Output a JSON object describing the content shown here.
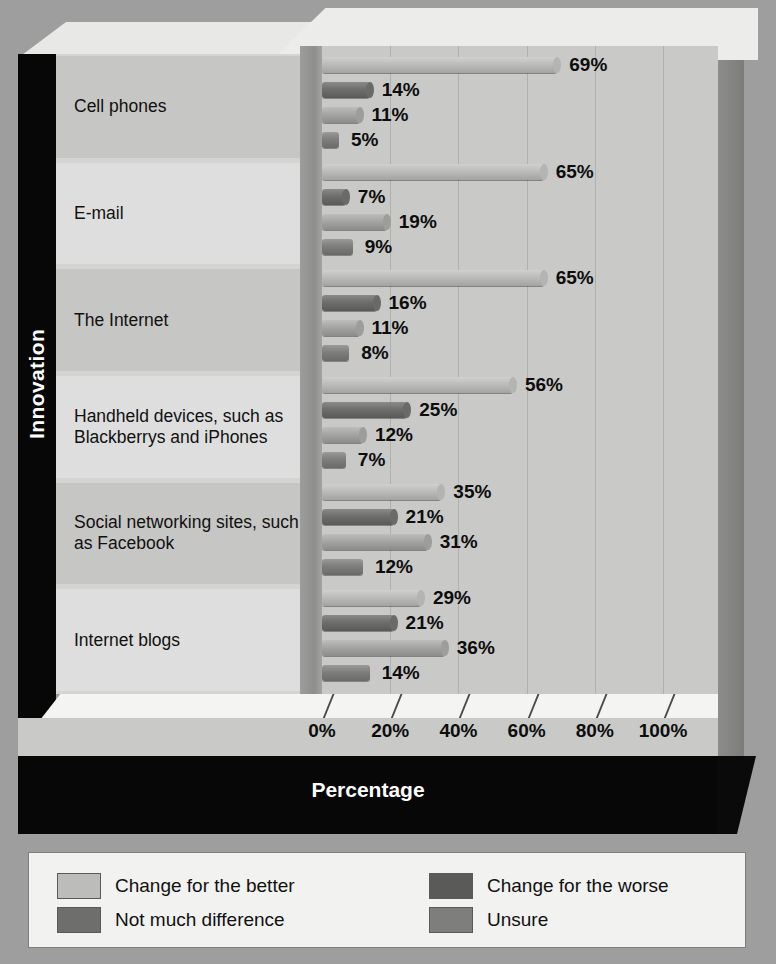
{
  "axis": {
    "y_title": "Innovation",
    "x_title": "Percentage",
    "x_ticks": [
      "0%",
      "20%",
      "40%",
      "60%",
      "80%",
      "100%"
    ]
  },
  "legend": {
    "items": [
      {
        "label": "Change for the better",
        "color": "#bcbcba"
      },
      {
        "label": "Change for the worse",
        "color": "#5a5a58"
      },
      {
        "label": "Not much difference",
        "color": "#6e6e6c"
      },
      {
        "label": "Unsure",
        "color": "#7e7e7c"
      }
    ]
  },
  "chart_data": {
    "type": "bar",
    "orientation": "horizontal",
    "title": "",
    "xlabel": "Percentage",
    "ylabel": "Innovation",
    "xlim": [
      0,
      100
    ],
    "xticks": [
      0,
      20,
      40,
      60,
      80,
      100
    ],
    "grid": true,
    "legend_position": "bottom",
    "categories": [
      "Cell phones",
      "E-mail",
      "The Internet",
      "Handheld devices, such as Blackberrys and iPhones",
      "Social networking sites, such as Facebook",
      "Internet blogs"
    ],
    "series": [
      {
        "name": "Change for the better",
        "values": [
          69,
          65,
          65,
          56,
          35,
          29
        ]
      },
      {
        "name": "Change for the worse",
        "values": [
          14,
          7,
          16,
          25,
          21,
          21
        ]
      },
      {
        "name": "Not much difference",
        "values": [
          11,
          19,
          11,
          12,
          31,
          36
        ]
      },
      {
        "name": "Unsure",
        "values": [
          5,
          9,
          8,
          7,
          12,
          14
        ]
      }
    ],
    "data_labels": [
      [
        "69%",
        "14%",
        "11%",
        "5%"
      ],
      [
        "65%",
        "7%",
        "19%",
        "9%"
      ],
      [
        "65%",
        "16%",
        "11%",
        "8%"
      ],
      [
        "56%",
        "25%",
        "12%",
        "7%"
      ],
      [
        "35%",
        "21%",
        "31%",
        "12%"
      ],
      [
        "29%",
        "21%",
        "36%",
        "14%"
      ]
    ]
  }
}
